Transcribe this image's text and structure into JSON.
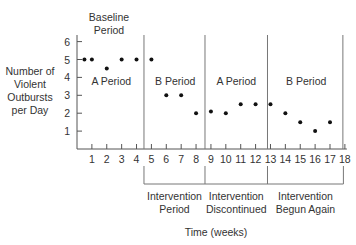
{
  "chart_data": {
    "type": "scatter",
    "title": "",
    "xlabel": "Time (weeks)",
    "ylabel": [
      "Number of",
      "Violent",
      "Outbursts",
      "per Day"
    ],
    "xlim": [
      0,
      18
    ],
    "ylim": [
      0,
      6
    ],
    "xticks": [
      1,
      2,
      3,
      4,
      5,
      6,
      7,
      8,
      9,
      10,
      11,
      12,
      13,
      14,
      15,
      16,
      17,
      18
    ],
    "yticks": [
      1,
      2,
      3,
      4,
      5,
      6
    ],
    "grid": false,
    "phase_boundaries": [
      4.5,
      8.6,
      12.8,
      18
    ],
    "phase_labels": [
      {
        "label": "A Period",
        "x_center": 2.3
      },
      {
        "label": "B Period",
        "x_center": 6.6
      },
      {
        "label": "A Period",
        "x_center": 10.7
      },
      {
        "label": "B Period",
        "x_center": 15.4
      }
    ],
    "top_annotation": [
      "Baseline",
      "Period"
    ],
    "bottom_brackets": [
      {
        "lines": [
          "Intervention",
          "Period"
        ],
        "from": 4.5,
        "to": 8.6
      },
      {
        "lines": [
          "Intervention",
          "Discontinued"
        ],
        "from": 8.6,
        "to": 12.8
      },
      {
        "lines": [
          "Intervention",
          "Begun Again"
        ],
        "from": 12.8,
        "to": 17.9
      }
    ],
    "points": [
      {
        "x": 0.5,
        "y": 5
      },
      {
        "x": 1,
        "y": 5
      },
      {
        "x": 2,
        "y": 4.5
      },
      {
        "x": 3,
        "y": 5
      },
      {
        "x": 4,
        "y": 5
      },
      {
        "x": 5,
        "y": 5
      },
      {
        "x": 6,
        "y": 3
      },
      {
        "x": 7,
        "y": 3
      },
      {
        "x": 8,
        "y": 2
      },
      {
        "x": 9,
        "y": 2.1
      },
      {
        "x": 10,
        "y": 2
      },
      {
        "x": 11,
        "y": 2.5
      },
      {
        "x": 12,
        "y": 2.5
      },
      {
        "x": 13,
        "y": 2.5
      },
      {
        "x": 14,
        "y": 2
      },
      {
        "x": 15,
        "y": 1.5
      },
      {
        "x": 16,
        "y": 1
      },
      {
        "x": 17,
        "y": 1.5
      }
    ]
  },
  "colors": {
    "axis": "#555555",
    "divider": "#777777",
    "point": "#111111",
    "text": "#333333"
  }
}
